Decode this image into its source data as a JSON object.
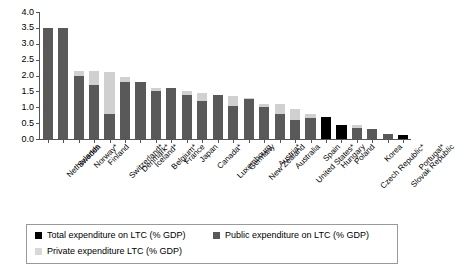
{
  "chart_data": {
    "type": "bar",
    "title": "",
    "subtitle": "",
    "xlabel": "",
    "ylabel": "",
    "ylim": [
      0.0,
      4.0
    ],
    "ytick_values": [
      0.0,
      0.5,
      1.0,
      1.5,
      2.0,
      2.5,
      3.0,
      3.5,
      4.0
    ],
    "ytick_labels": [
      "0.0",
      "0.5",
      "1.0",
      "1.5",
      "2.0",
      "2.5",
      "3.0",
      "3.5",
      "4.0"
    ],
    "grid": false,
    "stacked": true,
    "legend_position": "below-plot",
    "categories": [
      "Netherlands",
      "Sweden",
      "Norway*",
      "Finland",
      "Switzerland*",
      "Denmark*",
      "Iceland*",
      "Belgium*",
      "France",
      "Japan",
      "Canada*",
      "Luxembourg",
      "Germany",
      "New Zealand",
      "Austria*",
      "Australia",
      "United States*",
      "Spain",
      "Hungary",
      "Poland",
      "Czech Republic*",
      "Korea",
      "Slovak Republic",
      "Portugal*"
    ],
    "series": [
      {
        "name": "Public expenditure on LTC (% GDP)",
        "color": "#595959",
        "values": [
          3.5,
          3.5,
          2.0,
          1.7,
          0.8,
          1.8,
          1.8,
          1.5,
          1.6,
          1.4,
          1.2,
          1.4,
          1.05,
          1.25,
          1.0,
          0.8,
          0.6,
          0.65,
          null,
          null,
          0.35,
          0.3,
          0.15,
          null
        ]
      },
      {
        "name": "Private expenditure LTC (% GDP)",
        "color": "#d0d0d0",
        "values": [
          0.0,
          0.0,
          0.15,
          0.45,
          1.3,
          0.15,
          0.0,
          0.1,
          0.0,
          0.1,
          0.25,
          0.0,
          0.3,
          0.05,
          0.1,
          0.3,
          0.35,
          0.15,
          null,
          null,
          0.1,
          0.0,
          0.0,
          null
        ]
      },
      {
        "name": "Total expenditure on LTC (% GDP)",
        "color": "#000000",
        "values": [
          null,
          null,
          null,
          null,
          null,
          null,
          null,
          null,
          null,
          null,
          null,
          null,
          null,
          null,
          null,
          null,
          null,
          null,
          0.7,
          0.45,
          null,
          null,
          null,
          0.12
        ]
      }
    ],
    "totals": [
      3.5,
      3.5,
      2.15,
      2.15,
      2.1,
      1.95,
      1.8,
      1.6,
      1.6,
      1.5,
      1.45,
      1.4,
      1.35,
      1.3,
      1.1,
      1.1,
      0.95,
      0.8,
      0.7,
      0.45,
      0.45,
      0.3,
      0.15,
      0.12
    ]
  },
  "legend": {
    "items": [
      {
        "label": "Total expenditure on LTC (% GDP)",
        "color": "#000000",
        "key": "total"
      },
      {
        "label": "Public expenditure on LTC (% GDP)",
        "color": "#595959",
        "key": "public"
      },
      {
        "label": "Private expenditure LTC (% GDP)",
        "color": "#d8d8d8",
        "key": "private"
      }
    ]
  }
}
